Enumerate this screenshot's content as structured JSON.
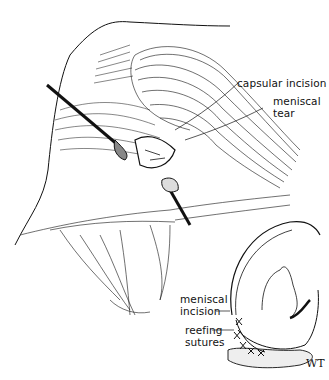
{
  "figure": {
    "main_view": {
      "labels": [
        {
          "id": "capsular_incision",
          "text": "capsular incision"
        },
        {
          "id": "meniscal",
          "text": "meniscal"
        },
        {
          "id": "tear",
          "text": "tear"
        }
      ]
    },
    "inset_view": {
      "labels": [
        {
          "id": "meniscal",
          "text": "meniscal"
        },
        {
          "id": "incision",
          "text": "incision"
        },
        {
          "id": "reefing",
          "text": "reefing"
        },
        {
          "id": "sutures",
          "text": "sutures"
        }
      ]
    },
    "signature": "WT"
  },
  "colors": {
    "ink": "#111111",
    "paper": "#ffffff",
    "shade": "#555555"
  }
}
